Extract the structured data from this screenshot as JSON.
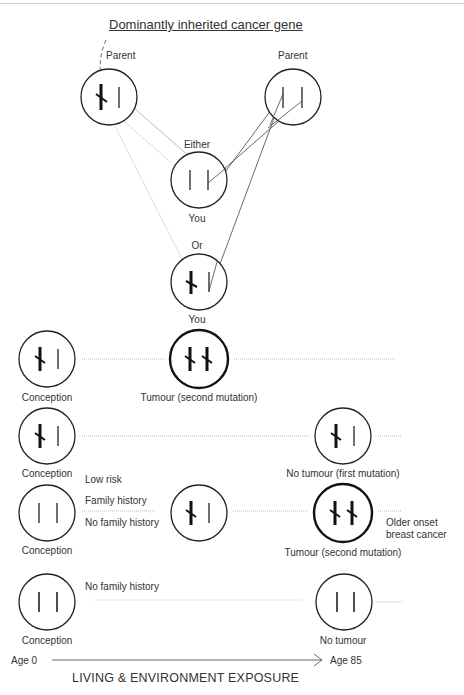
{
  "title": "Dominantly inherited cancer gene",
  "top_section": {
    "parent_left_label": "Parent",
    "parent_right_label": "Parent",
    "either_label": "Either",
    "you_label_1": "You",
    "or_label": "Or",
    "you_label_2": "You"
  },
  "row1": {
    "start_label": "Conception",
    "end_label": "Tumour (second mutation)"
  },
  "row2": {
    "start_label": "Conception",
    "end_label": "No tumour (first mutation)"
  },
  "row3": {
    "start_label": "Conception",
    "risk_label": "Low risk",
    "family_history_label": "Family history",
    "no_family_history_label": "No family history",
    "end_label": "Tumour (second mutation)",
    "outcome_line1": "Older onset",
    "outcome_line2": "breast cancer"
  },
  "row4": {
    "start_label": "Conception",
    "no_family_history_label": "No family history",
    "end_label": "No tumour"
  },
  "axis": {
    "start_label": "Age 0",
    "end_label": "Age 85",
    "caption": "LIVING & ENVIRONMENT EXPOSURE"
  },
  "legend_glyphs": {
    "normal_gene": "plain-vertical-bar",
    "mutated_gene": "bold-bar-with-slash"
  }
}
